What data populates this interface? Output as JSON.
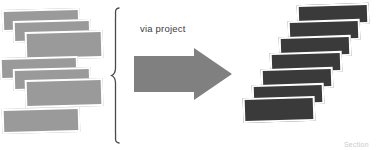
{
  "diagram": {
    "title": "via project",
    "background_color": "#ffffff",
    "width": 380,
    "height": 150,
    "transform_label": "via project",
    "bottom_caption": "Section",
    "colors": {
      "source_fill": "#9a9a9a",
      "target_fill": "#3a3a3a",
      "arrow_fill": "#808080",
      "card_border": "#ffffff",
      "brace_stroke": "#4a4a4a",
      "label_text": "#3d3d3d",
      "caption_text": "#c9c9c9"
    },
    "source_group": {
      "name": "source-documents",
      "count": 7,
      "fill": "#9a9a9a",
      "cards": [
        {
          "id": "source-card-1",
          "x": 2,
          "y": 9,
          "w": 78,
          "h": 22,
          "rotate": -1.6
        },
        {
          "id": "source-card-2",
          "x": 13,
          "y": 20,
          "w": 78,
          "h": 22,
          "rotate": -1.6
        },
        {
          "id": "source-card-3",
          "x": 25,
          "y": 31,
          "w": 78,
          "h": 28,
          "rotate": -1.6
        },
        {
          "id": "source-card-4",
          "x": 0,
          "y": 57,
          "w": 78,
          "h": 22,
          "rotate": -1.6
        },
        {
          "id": "source-card-5",
          "x": 13,
          "y": 68,
          "w": 78,
          "h": 22,
          "rotate": -1.6
        },
        {
          "id": "source-card-6",
          "x": 25,
          "y": 79,
          "w": 78,
          "h": 28,
          "rotate": -1.6
        },
        {
          "id": "source-card-7",
          "x": 2,
          "y": 108,
          "w": 78,
          "h": 25,
          "rotate": -1.6
        }
      ]
    },
    "target_group": {
      "name": "target-documents",
      "count": 7,
      "fill": "#3a3a3a",
      "cards": [
        {
          "id": "target-card-1",
          "x": 297,
          "y": 4,
          "w": 72,
          "h": 21,
          "rotate": -1.8
        },
        {
          "id": "target-card-2",
          "x": 288,
          "y": 20,
          "w": 72,
          "h": 21,
          "rotate": -1.8
        },
        {
          "id": "target-card-3",
          "x": 279,
          "y": 36,
          "w": 72,
          "h": 21,
          "rotate": -1.8
        },
        {
          "id": "target-card-4",
          "x": 270,
          "y": 52,
          "w": 72,
          "h": 21,
          "rotate": -1.8
        },
        {
          "id": "target-card-5",
          "x": 261,
          "y": 68,
          "w": 72,
          "h": 21,
          "rotate": -1.8
        },
        {
          "id": "target-card-6",
          "x": 252,
          "y": 84,
          "w": 72,
          "h": 21,
          "rotate": -1.8
        },
        {
          "id": "target-card-7",
          "x": 243,
          "y": 97,
          "w": 72,
          "h": 25,
          "rotate": -1.8
        }
      ]
    },
    "brace": {
      "name": "grouping-brace",
      "x": 113,
      "y": 8,
      "height": 134
    },
    "arrow": {
      "name": "transform-arrow",
      "direction": "right",
      "x": 134,
      "y": 48,
      "w": 98,
      "h": 52,
      "fill": "#808080"
    },
    "label_position": {
      "x": 140,
      "y": 23
    },
    "caption_position": {
      "x": 344,
      "y": 141
    }
  }
}
